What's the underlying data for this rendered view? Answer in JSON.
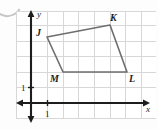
{
  "figure": {
    "name": "coordinate-grid-quadrilateral",
    "background_color": "#fdfdfd",
    "grid_color": "#d7d7d7",
    "axis_color": "#1d1d1d",
    "shape_color": "#6e6e6e"
  },
  "artifact": {
    "name": "scan-artifact",
    "visible": true
  },
  "axes": {
    "x_label": "x",
    "y_label": "y",
    "x_tick_label": "1",
    "y_tick_label": "1",
    "origin_px": {
      "x": 31,
      "y": 103
    },
    "grid_spacing_px": 15.6,
    "x_axis": {
      "start_px": 16,
      "end_px": 150,
      "y_px": 103,
      "arrow_both_ends": true
    },
    "y_axis": {
      "top_px": 11,
      "bottom_px": 122,
      "x_px": 31,
      "arrow_both_ends": true
    },
    "x_tick_px": 47,
    "y_tick_px": 87
  },
  "chart_data": {
    "type": "scatter",
    "title": "",
    "xlabel": "x",
    "ylabel": "y",
    "grid": true,
    "legend": null,
    "xlim": [
      -1,
      8
    ],
    "ylim": [
      -1,
      6
    ],
    "vertices": [
      {
        "label": "J",
        "x": 1,
        "y": 4.2,
        "px": 47,
        "py": 37,
        "label_pos": "left"
      },
      {
        "label": "K",
        "x": 5.1,
        "y": 5.0,
        "px": 110,
        "py": 25,
        "label_pos": "above"
      },
      {
        "label": "L",
        "x": 6.2,
        "y": 2.0,
        "px": 127,
        "py": 72,
        "label_pos": "below-right"
      },
      {
        "label": "M",
        "x": 2.05,
        "y": 2.0,
        "px": 63,
        "py": 72,
        "label_pos": "below-left"
      }
    ],
    "polygon_order": [
      "J",
      "K",
      "L",
      "M"
    ],
    "polygon_points_px": "47,37 110,25 127,72 63,72"
  },
  "grid_lines": {
    "vertical_px": [
      16,
      31,
      47,
      63,
      78,
      94,
      110,
      125,
      141,
      156
    ],
    "horizontal_px": [
      11,
      25,
      41,
      56,
      72,
      87,
      103,
      118
    ]
  }
}
